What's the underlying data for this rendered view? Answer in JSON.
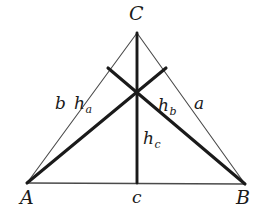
{
  "figure": {
    "kind": "geometry-diagram",
    "background_color": "#ffffff",
    "ink_color": "#1a1a1a",
    "thin_stroke_color": "#4a4a4a",
    "canvas": {
      "width": 261,
      "height": 212
    },
    "points": {
      "A": {
        "x": 27,
        "y": 183
      },
      "B": {
        "x": 245,
        "y": 184
      },
      "C": {
        "x": 137,
        "y": 33
      },
      "orthocenter": {
        "x": 137,
        "y": 88
      },
      "foot_on_AC": {
        "x": 108,
        "y": 68
      },
      "foot_on_BC": {
        "x": 166,
        "y": 68
      },
      "foot_on_AB": {
        "x": 137,
        "y": 183
      }
    },
    "sides": [
      {
        "name": "side-b",
        "label": "b",
        "from": "A",
        "to": "C",
        "weight": "thin"
      },
      {
        "name": "side-a",
        "label": "a",
        "from": "B",
        "to": "C",
        "weight": "thin"
      },
      {
        "name": "side-c",
        "label": "c",
        "from": "A",
        "to": "B",
        "weight": "thin"
      }
    ],
    "altitudes": [
      {
        "name": "altitude-ha",
        "label": "h",
        "subscript": "a",
        "from": "A",
        "to": "foot_on_BC",
        "weight": "thick"
      },
      {
        "name": "altitude-hb",
        "label": "h",
        "subscript": "b",
        "from": "B",
        "to": "foot_on_AC",
        "weight": "thick"
      },
      {
        "name": "altitude-hc",
        "label": "h",
        "subscript": "c",
        "from": "C",
        "to": "foot_on_AB",
        "weight": "thick"
      }
    ],
    "labels": {
      "vertex_A": "A",
      "vertex_B": "B",
      "vertex_C": "C",
      "side_a": "a",
      "side_b": "b",
      "side_c": "c",
      "altitude_a_base": "h",
      "altitude_a_sub": "a",
      "altitude_b_base": "h",
      "altitude_b_sub": "b",
      "altitude_c_base": "h",
      "altitude_c_sub": "c"
    }
  }
}
